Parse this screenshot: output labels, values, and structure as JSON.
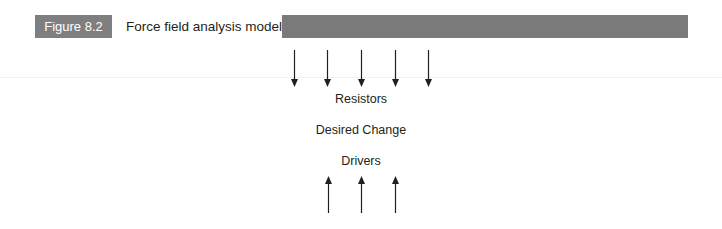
{
  "figure": {
    "number_label": "Figure 8.2",
    "title": "Force field analysis model"
  },
  "diagram": {
    "top_bar_color": "#7a7a7a",
    "resistor_arrows": {
      "count": 5,
      "direction": "down"
    },
    "driver_arrows": {
      "count": 3,
      "direction": "up"
    },
    "labels": {
      "resistors": "Resistors",
      "desired_change": "Desired Change",
      "drivers": "Drivers"
    }
  }
}
